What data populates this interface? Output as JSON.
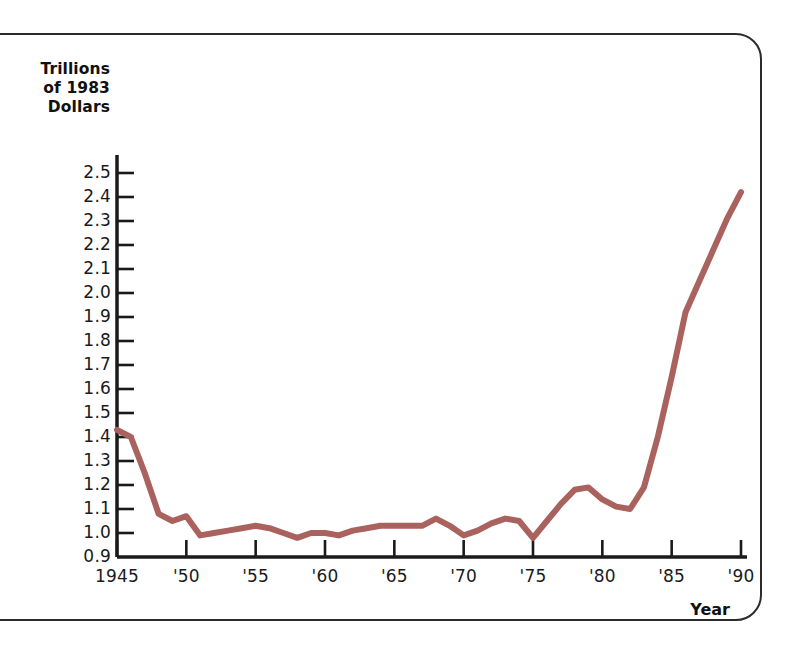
{
  "figure": {
    "frame_color": "#2b2b2b",
    "background": "#ffffff"
  },
  "chart_data": {
    "type": "line",
    "title": "",
    "ylabel": "Trillions of 1983 Dollars",
    "ylabel_lines": [
      "Trillions",
      "of 1983",
      "Dollars"
    ],
    "xlabel": "Year",
    "line_color": "#a9625e",
    "grid": false,
    "legend": null,
    "ylim": [
      0.9,
      2.5
    ],
    "xlim": [
      1945,
      1990
    ],
    "ytick_labels": [
      "2.5",
      "2.4",
      "2.3",
      "2.2",
      "2.1",
      "2.0",
      "1.9",
      "1.8",
      "1.7",
      "1.6",
      "1.5",
      "1.4",
      "1.3",
      "1.2",
      "1.1",
      "1.0",
      "0.9"
    ],
    "ytick_values": [
      2.5,
      2.4,
      2.3,
      2.2,
      2.1,
      2.0,
      1.9,
      1.8,
      1.7,
      1.6,
      1.5,
      1.4,
      1.3,
      1.2,
      1.1,
      1.0,
      0.9
    ],
    "xtick_labels": [
      "1945",
      "'50",
      "'55",
      "'60",
      "'65",
      "'70",
      "'75",
      "'80",
      "'85",
      "'90"
    ],
    "xtick_values": [
      1945,
      1950,
      1955,
      1960,
      1965,
      1970,
      1975,
      1980,
      1985,
      1990
    ],
    "x": [
      1945,
      1946,
      1947,
      1948,
      1949,
      1950,
      1951,
      1952,
      1953,
      1954,
      1955,
      1956,
      1957,
      1958,
      1959,
      1960,
      1961,
      1962,
      1963,
      1964,
      1965,
      1966,
      1967,
      1968,
      1969,
      1970,
      1971,
      1972,
      1973,
      1974,
      1975,
      1976,
      1977,
      1978,
      1979,
      1980,
      1981,
      1982,
      1983,
      1984,
      1985,
      1986,
      1987,
      1988,
      1989,
      1990
    ],
    "values": [
      1.43,
      1.4,
      1.25,
      1.08,
      1.05,
      1.07,
      0.99,
      1.0,
      1.01,
      1.02,
      1.03,
      1.02,
      1.0,
      0.98,
      1.0,
      1.0,
      0.99,
      1.01,
      1.02,
      1.03,
      1.03,
      1.03,
      1.03,
      1.06,
      1.03,
      0.99,
      1.01,
      1.04,
      1.06,
      1.05,
      0.98,
      1.05,
      1.12,
      1.18,
      1.19,
      1.14,
      1.11,
      1.1,
      1.19,
      1.4,
      1.65,
      1.92,
      2.05,
      2.18,
      2.31,
      2.42
    ]
  }
}
